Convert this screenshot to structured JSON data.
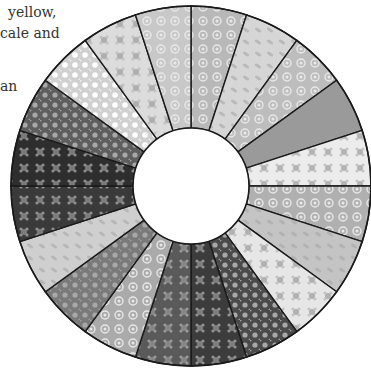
{
  "caption": {
    "lines": [
      {
        "text": "yellow,",
        "x": 8,
        "y": 2
      },
      {
        "text": "cale and",
        "x": 0,
        "y": 23
      },
      {
        "text": "an",
        "x": 0,
        "y": 76
      }
    ]
  },
  "quilt": {
    "center": [
      191,
      186
    ],
    "outer_radius": 180,
    "inner_radius": 58,
    "start_angle_deg": 0,
    "wedges": [
      {
        "name": "floral-swirl-light",
        "fill": "#b8b8b8",
        "pattern": "swirl"
      },
      {
        "name": "leaf-light",
        "fill": "#d6d6d6",
        "pattern": "leaf"
      },
      {
        "name": "floral-swirl",
        "fill": "#bdbdbd",
        "pattern": "swirl"
      },
      {
        "name": "solid-grey",
        "fill": "#9a9a9a",
        "pattern": "none"
      },
      {
        "name": "white-floral",
        "fill": "#ececec",
        "pattern": "flower"
      },
      {
        "name": "swirl-floral",
        "fill": "#b0b0b0",
        "pattern": "swirl"
      },
      {
        "name": "leaf-medium",
        "fill": "#c4c4c4",
        "pattern": "leaf"
      },
      {
        "name": "white-floral-2",
        "fill": "#e6e6e6",
        "pattern": "flower"
      },
      {
        "name": "dark-dots",
        "fill": "#4a4a4a",
        "pattern": "dots"
      },
      {
        "name": "dark-flowers",
        "fill": "#3c3c3c",
        "pattern": "flower"
      },
      {
        "name": "dark-flowers-2",
        "fill": "#5a5a5a",
        "pattern": "flower"
      },
      {
        "name": "swirl-grey",
        "fill": "#aaaaaa",
        "pattern": "swirl"
      },
      {
        "name": "grey-dots",
        "fill": "#7a7a7a",
        "pattern": "dots"
      },
      {
        "name": "light-grey-print",
        "fill": "#cfcfcf",
        "pattern": "leaf"
      },
      {
        "name": "dark-floral",
        "fill": "#3a3a3a",
        "pattern": "flower"
      },
      {
        "name": "dark-flowers-3",
        "fill": "#2e2e2e",
        "pattern": "flower"
      },
      {
        "name": "dark-dots-2",
        "fill": "#5e5e5e",
        "pattern": "dots"
      },
      {
        "name": "white-dots",
        "fill": "#d0d0d0",
        "pattern": "dots-light"
      },
      {
        "name": "light-floral",
        "fill": "#dcdcdc",
        "pattern": "flower"
      },
      {
        "name": "light-floral-2",
        "fill": "#c8c8c8",
        "pattern": "swirl"
      }
    ]
  }
}
